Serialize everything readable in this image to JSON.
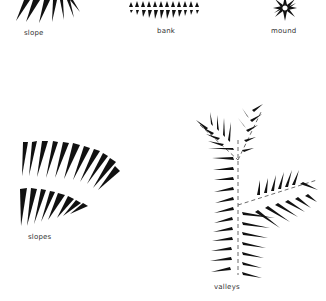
{
  "labels": {
    "slope": "slope",
    "bank": "bank",
    "mound": "mound",
    "slopes": "slopes",
    "valleys": "valleys"
  },
  "colors": {
    "ink": "#111111",
    "label": "#333333",
    "background": "#ffffff"
  },
  "symbols": [
    {
      "id": "slope",
      "type": "radiating-hachures",
      "count": 7
    },
    {
      "id": "bank",
      "type": "double-row-hachures",
      "rows": 2,
      "count_per_row": 13
    },
    {
      "id": "mound",
      "type": "starburst-hachures",
      "rays": 10
    },
    {
      "id": "slopes",
      "type": "curved-hachure-bands",
      "bands": 2,
      "counts": [
        11,
        8
      ]
    },
    {
      "id": "valleys",
      "type": "branching-feather-hachures",
      "branches": 3
    }
  ]
}
